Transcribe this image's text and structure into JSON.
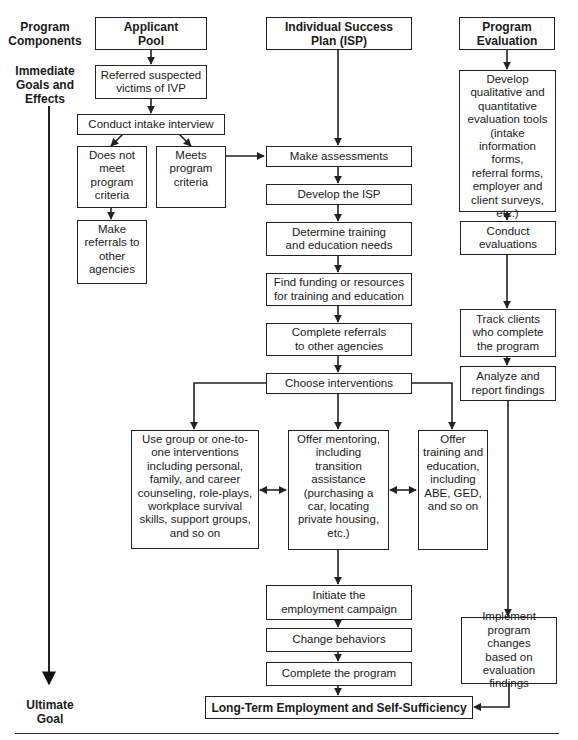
{
  "side_labels": {
    "program_components": "Program\nComponents",
    "immediate_goals": "Immediate\nGoals and\nEffects",
    "ultimate_goal": "Ultimate\nGoal"
  },
  "headers": {
    "applicant_pool": "Applicant\nPool",
    "isp": "Individual Success\nPlan (ISP)",
    "program_evaluation": "Program\nEvaluation"
  },
  "applicant": {
    "referred": "Referred suspected\nvictims of IVP",
    "intake": "Conduct intake interview",
    "not_meet": "Does not\nmeet\nprogram\ncriteria",
    "meets": "Meets\nprogram\ncriteria",
    "referrals": "Make\nreferrals to\nother\nagencies"
  },
  "isp": {
    "assess": "Make assessments",
    "develop": "Develop the ISP",
    "determine": "Determine training\nand education needs",
    "funding": "Find funding or resources\nfor training and education",
    "complete_referrals": "Complete referrals\nto other agencies",
    "choose": "Choose interventions",
    "group": "Use group or one-to-\none interventions\nincluding personal,\nfamily, and career\ncounseling, role-plays,\nworkplace survival\nskills, support groups,\nand so on",
    "mentoring": "Offer mentoring,\nincluding\ntransition\nassistance\n(purchasing a\ncar, locating\nprivate housing,\netc.)",
    "training": "Offer\ntraining and\neducation,\nincluding\nABE, GED,\nand so on",
    "initiate": "Initiate the\nemployment campaign",
    "change": "Change behaviors",
    "complete_program": "Complete the program"
  },
  "evaluation": {
    "develop_tools": "Develop\nqualitative and\nquantitative\nevaluation tools\n(intake\ninformation forms,\nreferral forms,\nemployer and\nclient surveys,\netc.)",
    "conduct": "Conduct\nevaluations",
    "track": "Track clients\nwho complete\nthe program",
    "analyze": "Analyze and\nreport findings",
    "implement": "Implement\nprogram changes\nbased on\nevaluation findings"
  },
  "ultimate": {
    "goal": "Long-Term Employment and Self-Sufficiency"
  },
  "colors": {
    "line": "#222222",
    "background": "#ffffff"
  }
}
